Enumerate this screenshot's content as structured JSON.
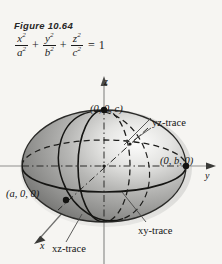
{
  "figure": {
    "caption": "Figure 10.64",
    "equation_text": "x^2/a^2 + y^2/b^2 + z^2/c^2 = 1",
    "equation_parts": {
      "term1_num": "x",
      "term1_den": "a",
      "term2_num": "y",
      "term2_den": "b",
      "term3_num": "z",
      "term3_den": "c",
      "exponent": "2",
      "plus": "+",
      "equals": "=",
      "rhs": "1"
    },
    "surface_name": "ellipsoid"
  },
  "axes": {
    "z_label": "z",
    "y_label": "y",
    "x_label": "x"
  },
  "points": {
    "top_intercept": "(0, 0, c)",
    "right_intercept": "(0, b, 0)",
    "front_intercept": "(a, 0, 0)"
  },
  "traces": {
    "yz": "yz-trace",
    "xy": "xy-trace",
    "xz": "xz-trace"
  },
  "colors": {
    "background": "#f6f5f2",
    "ink": "#141414",
    "surface_light": "#fbfbfa",
    "surface_mid": "#9a9a9a",
    "surface_dark": "#5d5d5d",
    "axis_gray": "#8a8a8a"
  }
}
